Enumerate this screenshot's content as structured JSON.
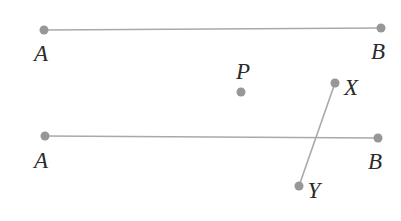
{
  "figure": {
    "width": 401,
    "height": 221,
    "background": "#ffffff",
    "style": {
      "line_color": "#a9a9a9",
      "dot_color": "#979797",
      "label_color": "#2b2b2b",
      "line_width": 1.6,
      "dot_radius": 4.5,
      "label_font_size": 23
    },
    "segments": [
      {
        "name": "segment-ab-top",
        "from": "A-top",
        "to": "B-top",
        "x1": 44,
        "y1": 30,
        "x2": 381,
        "y2": 28
      },
      {
        "name": "segment-ab-bottom",
        "from": "A-bottom",
        "to": "B-bottom",
        "x1": 45,
        "y1": 136,
        "x2": 378,
        "y2": 138
      },
      {
        "name": "segment-xy",
        "from": "X",
        "to": "Y",
        "x1": 335,
        "y1": 83,
        "x2": 299,
        "y2": 186
      }
    ],
    "points": [
      {
        "name": "A-top",
        "label": "A",
        "dot": {
          "x": 44,
          "y": 30
        },
        "label_pos": {
          "x": 41,
          "y": 53
        }
      },
      {
        "name": "B-top",
        "label": "B",
        "dot": {
          "x": 381,
          "y": 28
        },
        "label_pos": {
          "x": 378,
          "y": 51
        }
      },
      {
        "name": "P",
        "label": "P",
        "dot": {
          "x": 241,
          "y": 92
        },
        "label_pos": {
          "x": 243,
          "y": 71
        }
      },
      {
        "name": "X",
        "label": "X",
        "dot": {
          "x": 335,
          "y": 83
        },
        "label_pos": {
          "x": 351,
          "y": 87
        }
      },
      {
        "name": "A-bottom",
        "label": "A",
        "dot": {
          "x": 45,
          "y": 136
        },
        "label_pos": {
          "x": 41,
          "y": 160
        }
      },
      {
        "name": "B-bottom",
        "label": "B",
        "dot": {
          "x": 378,
          "y": 138
        },
        "label_pos": {
          "x": 375,
          "y": 161
        }
      },
      {
        "name": "Y",
        "label": "Y",
        "dot": {
          "x": 299,
          "y": 186
        },
        "label_pos": {
          "x": 314,
          "y": 190
        }
      }
    ]
  }
}
